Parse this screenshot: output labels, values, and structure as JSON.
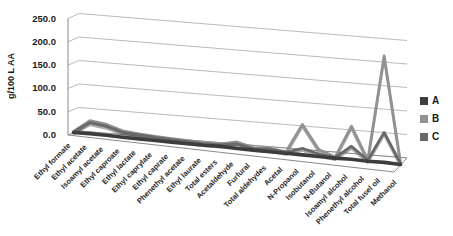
{
  "chart_data": {
    "type": "line",
    "subtype": "3d-line",
    "title": "",
    "xlabel": "",
    "ylabel": "g/100 L AA",
    "ylim": [
      0,
      250
    ],
    "ytick_step": 50,
    "ytick_labels": [
      "0.0",
      "50.0",
      "100.0",
      "150.0",
      "200.0",
      "250.0"
    ],
    "grid": true,
    "legend_position": "right",
    "background": "#ffffff",
    "gridline_color": "#a8a8a8",
    "axis_color": "#8a8a8a",
    "categories": [
      "Ethyl formate",
      "Ethyl acetate",
      "Isoamyl acetate",
      "Ethyl caproate",
      "Ethyl lactate",
      "Ethyl caprylate",
      "Ethyl caprate",
      "Phenethyl acetate",
      "Ethyl laurate",
      "Total esters",
      "Acetaldehyde",
      "Furfural",
      "Total aldehydes",
      "Acetal",
      "N-Propanol",
      "Isobutanol",
      "N-Butanol",
      "Isoamyl alcohol",
      "Phenethyl alcohol",
      "Total fusel oil",
      "Methanol"
    ],
    "series": [
      {
        "name": "A",
        "color": "#3d3d3d",
        "values": [
          1,
          2,
          2,
          1,
          1,
          1,
          1,
          1,
          1,
          2,
          1,
          1,
          1,
          1,
          1,
          1,
          1,
          2,
          1,
          2,
          1
        ]
      },
      {
        "name": "B",
        "color": "#929292",
        "values": [
          3,
          28,
          24,
          14,
          11,
          9,
          8,
          7,
          6,
          7,
          14,
          6,
          8,
          4,
          62,
          15,
          3,
          68,
          4,
          215,
          5
        ]
      },
      {
        "name": "C",
        "color": "#696969",
        "values": [
          2,
          24,
          20,
          11,
          9,
          7,
          6,
          5,
          4,
          5,
          10,
          4,
          6,
          3,
          14,
          6,
          2,
          28,
          3,
          62,
          3
        ]
      }
    ]
  }
}
